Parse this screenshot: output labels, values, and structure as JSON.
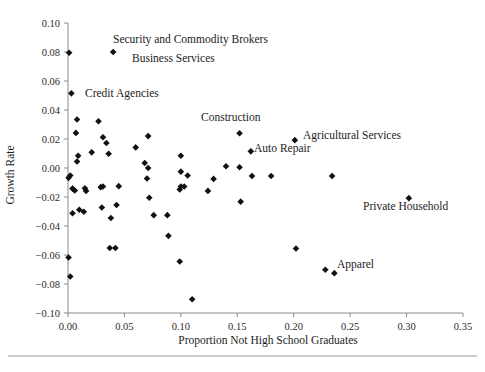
{
  "figure": {
    "width": 485,
    "height": 372,
    "background": "#ffffff",
    "marker_color": "#111111",
    "axis_color": "#8a8a8a",
    "footer_rule": true
  },
  "chart_data": {
    "type": "scatter",
    "title": "",
    "xlabel": "Proportion Not High School Graduates",
    "ylabel": "Growth Rate",
    "xlim": [
      0.0,
      0.35
    ],
    "ylim": [
      -0.1,
      0.1
    ],
    "xticks": [
      0.0,
      0.05,
      0.1,
      0.15,
      0.2,
      0.25,
      0.3,
      0.35
    ],
    "xtick_labels": [
      "0.00",
      "0.05",
      "0.10",
      "0.15",
      "0.20",
      "0.25",
      "0.30",
      "0.35"
    ],
    "yticks": [
      -0.1,
      -0.08,
      -0.06,
      -0.04,
      -0.02,
      0.0,
      0.02,
      0.04,
      0.06,
      0.08,
      0.1
    ],
    "ytick_labels": [
      "-0.10",
      "-0.08",
      "-0.06",
      "-0.04",
      "-0.02",
      "0.00",
      "0.02",
      "0.04",
      "0.06",
      "0.08",
      "0.10"
    ],
    "grid": false,
    "legend": null,
    "marker": "diamond",
    "points": [
      {
        "x": 0.001,
        "y": 0.0795
      },
      {
        "x": 0.04,
        "y": 0.08
      },
      {
        "x": 0.003,
        "y": 0.0515
      },
      {
        "x": 0.007,
        "y": 0.0242
      },
      {
        "x": 0.008,
        "y": 0.0045
      },
      {
        "x": 0.009,
        "y": 0.0085
      },
      {
        "x": 0.0005,
        "y": -0.0068
      },
      {
        "x": 0.002,
        "y": -0.0052
      },
      {
        "x": 0.004,
        "y": -0.0142
      },
      {
        "x": 0.006,
        "y": -0.0155
      },
      {
        "x": 0.004,
        "y": -0.0312
      },
      {
        "x": 0.0005,
        "y": -0.0617
      },
      {
        "x": 0.002,
        "y": -0.0748
      },
      {
        "x": 0.008,
        "y": 0.0335
      },
      {
        "x": 0.021,
        "y": 0.0108
      },
      {
        "x": 0.015,
        "y": -0.014
      },
      {
        "x": 0.016,
        "y": -0.0158
      },
      {
        "x": 0.01,
        "y": -0.0288
      },
      {
        "x": 0.014,
        "y": -0.0302
      },
      {
        "x": 0.027,
        "y": 0.0322
      },
      {
        "x": 0.031,
        "y": 0.0212
      },
      {
        "x": 0.034,
        "y": 0.0172
      },
      {
        "x": 0.036,
        "y": 0.0098
      },
      {
        "x": 0.029,
        "y": -0.0132
      },
      {
        "x": 0.031,
        "y": -0.0128
      },
      {
        "x": 0.03,
        "y": -0.0272
      },
      {
        "x": 0.038,
        "y": -0.0345
      },
      {
        "x": 0.037,
        "y": -0.0552
      },
      {
        "x": 0.042,
        "y": -0.0552
      },
      {
        "x": 0.045,
        "y": -0.0125
      },
      {
        "x": 0.043,
        "y": -0.0255
      },
      {
        "x": 0.06,
        "y": 0.0142
      },
      {
        "x": 0.071,
        "y": 0.022
      },
      {
        "x": 0.068,
        "y": 0.0035
      },
      {
        "x": 0.071,
        "y": 0.0
      },
      {
        "x": 0.07,
        "y": -0.0072
      },
      {
        "x": 0.072,
        "y": -0.0205
      },
      {
        "x": 0.076,
        "y": -0.0325
      },
      {
        "x": 0.088,
        "y": -0.0325
      },
      {
        "x": 0.089,
        "y": -0.0468
      },
      {
        "x": 0.1,
        "y": 0.0085
      },
      {
        "x": 0.1,
        "y": -0.0025
      },
      {
        "x": 0.099,
        "y": -0.0148
      },
      {
        "x": 0.1,
        "y": -0.0128
      },
      {
        "x": 0.103,
        "y": -0.0128
      },
      {
        "x": 0.106,
        "y": -0.0052
      },
      {
        "x": 0.099,
        "y": -0.0645
      },
      {
        "x": 0.11,
        "y": -0.0905
      },
      {
        "x": 0.124,
        "y": -0.0158
      },
      {
        "x": 0.129,
        "y": -0.0075
      },
      {
        "x": 0.14,
        "y": 0.0012
      },
      {
        "x": 0.152,
        "y": 0.024
      },
      {
        "x": 0.152,
        "y": 0.0005
      },
      {
        "x": 0.153,
        "y": -0.0232
      },
      {
        "x": 0.162,
        "y": 0.0115
      },
      {
        "x": 0.163,
        "y": -0.0055
      },
      {
        "x": 0.18,
        "y": -0.0055
      },
      {
        "x": 0.201,
        "y": 0.0192
      },
      {
        "x": 0.202,
        "y": -0.0555
      },
      {
        "x": 0.228,
        "y": -0.0702
      },
      {
        "x": 0.236,
        "y": -0.0725
      },
      {
        "x": 0.234,
        "y": -0.0055
      },
      {
        "x": 0.302,
        "y": -0.0208
      }
    ],
    "annotations": [
      {
        "text": "Security and Commodity Brokers",
        "x": 0.04,
        "y": 0.08,
        "anchor": "start",
        "label_x": 113,
        "label_y": 43
      },
      {
        "text": "Business Services",
        "x": 0.04,
        "y": 0.08,
        "anchor": "start",
        "label_x": 132,
        "label_y": 62
      },
      {
        "text": "Credit Agencies",
        "x": 0.003,
        "y": 0.0515,
        "anchor": "start",
        "label_x": 85,
        "label_y": 97
      },
      {
        "text": "Construction",
        "x": 0.152,
        "y": 0.024,
        "anchor": "start",
        "label_x": 201,
        "label_y": 121
      },
      {
        "text": "Agricultural Services",
        "x": 0.201,
        "y": 0.0192,
        "anchor": "start",
        "label_x": 303,
        "label_y": 139
      },
      {
        "text": "Auto Repair",
        "x": 0.162,
        "y": 0.0115,
        "anchor": "start",
        "label_x": 254,
        "label_y": 152
      },
      {
        "text": "Private Household",
        "x": 0.302,
        "y": -0.0208,
        "anchor": "start",
        "label_x": 363,
        "label_y": 210
      },
      {
        "text": "Apparel",
        "x": 0.236,
        "y": -0.0725,
        "anchor": "start",
        "label_x": 337,
        "label_y": 268
      }
    ]
  }
}
